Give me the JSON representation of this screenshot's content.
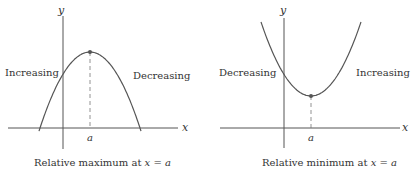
{
  "panels": [
    {
      "id": "maximum",
      "axis_x_label": "x",
      "axis_y_label": "y",
      "point_label": "a",
      "left_region_label": "Increasing",
      "right_region_label": "Decreasing",
      "caption_text": "Relative maximum at ",
      "caption_math": "x = a",
      "curve_shape": "concave-down parabola"
    },
    {
      "id": "minimum",
      "axis_x_label": "x",
      "axis_y_label": "y",
      "point_label": "a",
      "left_region_label": "Decreasing",
      "right_region_label": "Increasing",
      "caption_text": "Relative minimum at ",
      "caption_math": "x = a",
      "curve_shape": "concave-up parabola"
    }
  ],
  "colors": {
    "stroke": "#555555",
    "text": "#333333",
    "background": "#ffffff"
  }
}
